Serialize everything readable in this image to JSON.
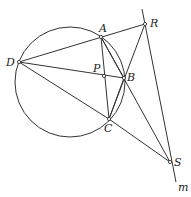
{
  "diagram": {
    "type": "geometry",
    "circle": {
      "cx": 70,
      "cy": 82,
      "r": 55
    },
    "points": {
      "A": {
        "x": 101,
        "y": 37,
        "label": "A",
        "lx": 99,
        "ly": 32
      },
      "B": {
        "x": 124,
        "y": 78,
        "label": "B",
        "lx": 127,
        "ly": 81
      },
      "C": {
        "x": 109,
        "y": 119,
        "label": "C",
        "lx": 104,
        "ly": 132
      },
      "D": {
        "x": 19,
        "y": 62,
        "label": "D",
        "lx": 6,
        "ly": 66
      },
      "P": {
        "x": 104,
        "y": 76,
        "label": "P",
        "lx": 93,
        "ly": 72
      },
      "R": {
        "x": 145,
        "y": 24,
        "label": "R",
        "lx": 150,
        "ly": 27
      },
      "S": {
        "x": 170,
        "y": 162,
        "label": "S",
        "lx": 174,
        "ly": 166
      }
    },
    "line_m": {
      "label": "m",
      "x1": 142,
      "y1": 9,
      "x2": 176,
      "y2": 182,
      "lx": 178,
      "ly": 191
    },
    "segments": [
      [
        "D",
        "R"
      ],
      [
        "D",
        "B"
      ],
      [
        "D",
        "C"
      ],
      [
        "A",
        "C"
      ],
      [
        "A",
        "S"
      ],
      [
        "R",
        "C"
      ],
      [
        "C",
        "S"
      ],
      [
        "A",
        "B"
      ],
      [
        "B",
        "C"
      ]
    ]
  }
}
